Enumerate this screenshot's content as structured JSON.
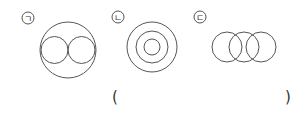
{
  "figures": [
    {
      "label": "ㄱ",
      "description": "large circle containing two touching small circles"
    },
    {
      "label": "ㄴ",
      "description": "three concentric circles"
    },
    {
      "label": "ㄷ",
      "description": "three overlapping circles in a row"
    }
  ],
  "answer_blank": {
    "open": "(",
    "close": ")"
  },
  "colors": {
    "stroke": "#555555"
  }
}
